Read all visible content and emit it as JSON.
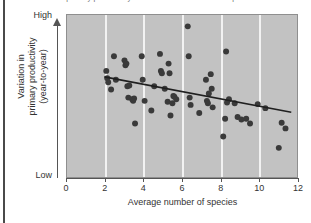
{
  "figure": {
    "top_caption": "variation in primary productivity decreases as the number of species increases",
    "background_color": "#ffffff",
    "plot_background_color": "#c2c2c2",
    "gridline_color": "#f2f2f2",
    "point_color": "#3a3a3a",
    "trendline_color": "#1f1f1f"
  },
  "chart_data": {
    "type": "scatter",
    "title": "",
    "xlabel": "Average number of species",
    "ylabel": "Variation in primary productivity (year-to-year)",
    "ylabel_line1": "Variation in",
    "ylabel_line2": "primary productivity",
    "ylabel_line3": "(year-to-year)",
    "xlim": [
      0,
      12
    ],
    "ylim": [
      0,
      1
    ],
    "xticks": [
      0,
      2,
      4,
      6,
      8,
      10,
      12
    ],
    "xticklabels": [
      "0",
      "2",
      "4",
      "6",
      "8",
      "10",
      "12"
    ],
    "yticks": [
      0,
      1
    ],
    "yticklabels": [
      "Low",
      "High"
    ],
    "y_axis_style": "arrow-up-qualitative",
    "gridlines": {
      "vertical_at": [
        2,
        4,
        6,
        8,
        10
      ],
      "horizontal": false,
      "color": "#f2f2f2"
    },
    "legend": null,
    "n_points": 60,
    "points": [
      [
        2.05,
        0.655
      ],
      [
        2.1,
        0.61
      ],
      [
        2.15,
        0.585
      ],
      [
        2.3,
        0.54
      ],
      [
        2.45,
        0.745
      ],
      [
        2.55,
        0.6
      ],
      [
        3.0,
        0.72
      ],
      [
        3.05,
        0.69
      ],
      [
        3.1,
        0.7
      ],
      [
        3.15,
        0.56
      ],
      [
        3.25,
        0.565
      ],
      [
        3.2,
        0.49
      ],
      [
        3.4,
        0.48
      ],
      [
        3.5,
        0.485
      ],
      [
        3.45,
        0.47
      ],
      [
        3.55,
        0.33
      ],
      [
        3.9,
        0.745
      ],
      [
        3.95,
        0.6
      ],
      [
        4.05,
        0.47
      ],
      [
        4.4,
        0.41
      ],
      [
        4.55,
        0.56
      ],
      [
        4.85,
        0.76
      ],
      [
        4.9,
        0.655
      ],
      [
        4.95,
        0.64
      ],
      [
        5.1,
        0.545
      ],
      [
        5.25,
        0.465
      ],
      [
        5.3,
        0.7
      ],
      [
        5.35,
        0.64
      ],
      [
        5.4,
        0.38
      ],
      [
        5.5,
        0.455
      ],
      [
        5.55,
        0.5
      ],
      [
        5.6,
        0.495
      ],
      [
        5.7,
        0.48
      ],
      [
        6.3,
        0.93
      ],
      [
        6.35,
        0.745
      ],
      [
        6.4,
        0.49
      ],
      [
        6.9,
        0.395
      ],
      [
        7.25,
        0.6
      ],
      [
        7.3,
        0.47
      ],
      [
        7.35,
        0.455
      ],
      [
        7.4,
        0.515
      ],
      [
        7.5,
        0.635
      ],
      [
        7.6,
        0.43
      ],
      [
        8.15,
        0.25
      ],
      [
        8.25,
        0.36
      ],
      [
        8.3,
        0.775
      ],
      [
        8.35,
        0.46
      ],
      [
        8.45,
        0.48
      ],
      [
        8.75,
        0.455
      ],
      [
        8.9,
        0.37
      ],
      [
        9.1,
        0.355
      ],
      [
        9.35,
        0.36
      ],
      [
        9.55,
        0.33
      ],
      [
        9.95,
        0.45
      ],
      [
        10.35,
        0.425
      ],
      [
        11.05,
        0.18
      ],
      [
        11.2,
        0.335
      ],
      [
        11.4,
        0.3
      ],
      [
        7.55,
        0.545
      ],
      [
        6.45,
        0.445
      ]
    ],
    "trendline": {
      "type": "linear-fit",
      "x_start": 1.95,
      "y_start": 0.618,
      "x_end": 11.7,
      "y_end": 0.4,
      "color": "#1f1f1f",
      "width": 1.6
    },
    "relationship": "negative",
    "grid": true,
    "legend_position": "none"
  }
}
